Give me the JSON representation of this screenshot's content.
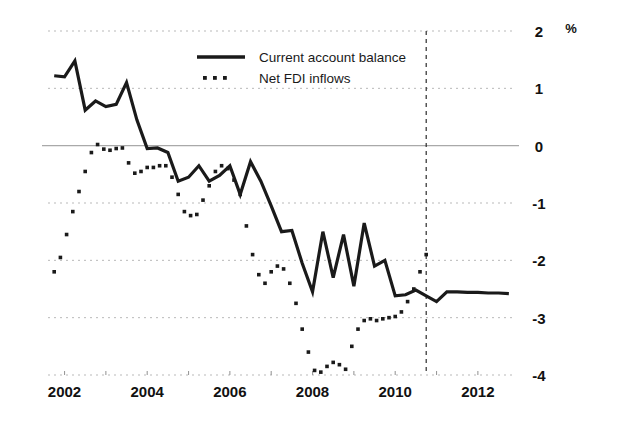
{
  "chart_data": {
    "type": "line",
    "title": "",
    "subtitle": "",
    "xlabel": "",
    "ylabel": "",
    "unit_label": "%",
    "xlim": [
      2001.6,
      2012.85
    ],
    "ylim": [
      -4,
      2
    ],
    "yticks": [
      2,
      1,
      0,
      -1,
      -2,
      -3,
      -4
    ],
    "ytick_labels": [
      "2",
      "1",
      "0",
      "-1",
      "-2",
      "-3",
      "-4"
    ],
    "xticks": [
      2002,
      2003,
      2004,
      2005,
      2006,
      2007,
      2008,
      2009,
      2010,
      2011,
      2012
    ],
    "xtick_labels_major": [
      "2002",
      "2004",
      "2006",
      "2008",
      "2010",
      "2012"
    ],
    "xtick_major_values": [
      2002,
      2004,
      2006,
      2008,
      2010,
      2012
    ],
    "grid": true,
    "grid_style": "dotted",
    "zero_line": true,
    "legend_position": "top-center",
    "forecast_divider_x": 2010.75,
    "forecast_divider_style": "dashed-vertical",
    "series": [
      {
        "name": "Current account balance",
        "style": "solid",
        "color": "#1a1a1a",
        "x": [
          2001.75,
          2002.0,
          2002.25,
          2002.5,
          2002.75,
          2003.0,
          2003.25,
          2003.5,
          2003.75,
          2004.0,
          2004.25,
          2004.5,
          2004.75,
          2005.0,
          2005.25,
          2005.5,
          2005.75,
          2006.0,
          2006.25,
          2006.5,
          2006.75,
          2007.0,
          2007.25,
          2007.5,
          2007.75,
          2008.0,
          2008.25,
          2008.5,
          2008.75,
          2009.0,
          2009.25,
          2009.5,
          2009.75,
          2010.0,
          2010.25,
          2010.5,
          2010.75,
          2011.0,
          2011.25,
          2011.5,
          2011.75,
          2012.0,
          2012.25,
          2012.5,
          2012.75
        ],
        "values": [
          1.22,
          1.2,
          1.48,
          0.62,
          0.78,
          0.68,
          0.72,
          1.1,
          0.45,
          -0.05,
          -0.04,
          -0.12,
          -0.62,
          -0.55,
          -0.35,
          -0.62,
          -0.52,
          -0.35,
          -0.85,
          -0.28,
          -0.62,
          -1.05,
          -1.5,
          -1.48,
          -2.05,
          -2.55,
          -1.5,
          -2.3,
          -1.55,
          -2.45,
          -1.35,
          -2.1,
          -2.0,
          -2.62,
          -2.6,
          -2.52,
          -2.62,
          -2.72,
          -2.55,
          -2.55,
          -2.56,
          -2.56,
          -2.57,
          -2.57,
          -2.58
        ]
      },
      {
        "name": "Net FDI inflows",
        "style": "dotted",
        "color": "#1a1a1a",
        "x": [
          2001.75,
          2001.9,
          2002.05,
          2002.2,
          2002.35,
          2002.5,
          2002.65,
          2002.8,
          2002.95,
          2003.1,
          2003.25,
          2003.4,
          2003.55,
          2003.7,
          2003.85,
          2004.0,
          2004.15,
          2004.3,
          2004.45,
          2004.6,
          2004.75,
          2004.9,
          2005.05,
          2005.2,
          2005.35,
          2005.5,
          2005.65,
          2005.8,
          2005.95,
          2006.1,
          2006.25,
          2006.4,
          2006.55,
          2006.7,
          2006.85,
          2007.0,
          2007.15,
          2007.3,
          2007.45,
          2007.6,
          2007.75,
          2007.9,
          2008.05,
          2008.2,
          2008.35,
          2008.5,
          2008.65,
          2008.8,
          2008.95,
          2009.1,
          2009.25,
          2009.4,
          2009.55,
          2009.7,
          2009.85,
          2010.0,
          2010.15,
          2010.3,
          2010.45,
          2010.6,
          2010.75
        ],
        "values": [
          -2.2,
          -1.95,
          -1.55,
          -1.15,
          -0.8,
          -0.45,
          -0.12,
          0.02,
          -0.06,
          -0.08,
          -0.05,
          -0.04,
          -0.3,
          -0.48,
          -0.45,
          -0.38,
          -0.38,
          -0.35,
          -0.35,
          -0.55,
          -0.85,
          -1.15,
          -1.22,
          -1.2,
          -0.95,
          -0.7,
          -0.45,
          -0.35,
          -0.4,
          -0.6,
          -0.85,
          -1.4,
          -1.9,
          -2.25,
          -2.4,
          -2.2,
          -2.1,
          -2.15,
          -2.4,
          -2.75,
          -3.2,
          -3.6,
          -3.92,
          -3.95,
          -3.85,
          -3.78,
          -3.82,
          -3.9,
          -3.5,
          -3.2,
          -3.05,
          -3.02,
          -3.05,
          -3.02,
          -3.0,
          -2.98,
          -2.9,
          -2.72,
          -2.5,
          -2.2,
          -1.9
        ]
      }
    ]
  },
  "legend": {
    "items": [
      {
        "label": "Current account balance",
        "style": "solid"
      },
      {
        "label": "Net FDI inflows",
        "style": "dotted"
      }
    ]
  },
  "axis": {
    "unit": "%",
    "y_labels": [
      "2",
      "1",
      "0",
      "-1",
      "-2",
      "-3",
      "-4"
    ],
    "x_labels": [
      "2002",
      "2004",
      "2006",
      "2008",
      "2010",
      "2012"
    ]
  }
}
